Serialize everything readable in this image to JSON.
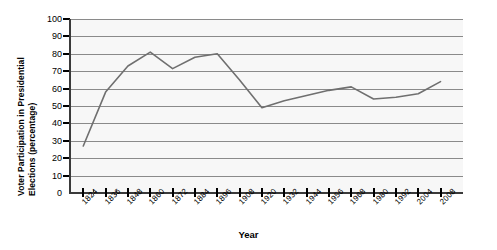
{
  "chart_data": {
    "type": "line",
    "title": "",
    "xlabel": "Year",
    "ylabel": "Voter Participation in Presidential Elections (percentage)",
    "ylabel_line1": "Voter Participation in Presidential",
    "ylabel_line2": "Elections (percentage)",
    "ylim": [
      0,
      100
    ],
    "ytick_step": 10,
    "ytick_labels": [
      "100",
      "90",
      "80",
      "70",
      "60",
      "50",
      "40",
      "30",
      "20",
      "10",
      "0"
    ],
    "ytick_values": [
      100,
      90,
      80,
      70,
      60,
      50,
      40,
      30,
      20,
      10,
      0
    ],
    "grid": true,
    "grid_axis": "y",
    "legend": "none",
    "xtick_labels": [
      "1824",
      "1836",
      "1848",
      "1860",
      "1872",
      "1884",
      "1896",
      "1908",
      "1920",
      "1932",
      "1944",
      "1956",
      "1968",
      "1980",
      "1992",
      "2004",
      "2008"
    ],
    "x": [
      1824,
      1836,
      1848,
      1860,
      1872,
      1884,
      1896,
      1908,
      1920,
      1932,
      1944,
      1956,
      1968,
      1980,
      1992,
      2004,
      2008
    ],
    "values": [
      27,
      58,
      73,
      81,
      71.5,
      78,
      80,
      65,
      49,
      53,
      56,
      59,
      61,
      54,
      55,
      57,
      64
    ],
    "series": [
      {
        "name": "Voter Participation",
        "color": "#6f6f6f",
        "values": [
          27,
          58,
          73,
          81,
          71.5,
          78,
          80,
          65,
          49,
          53,
          56,
          59,
          61,
          54,
          55,
          57,
          64
        ]
      }
    ],
    "line_color": "#6f6f6f",
    "plot_background": "#f7f7f7",
    "gridline_color": "#8a8a8a",
    "axis_color": "#3a3a3a"
  }
}
